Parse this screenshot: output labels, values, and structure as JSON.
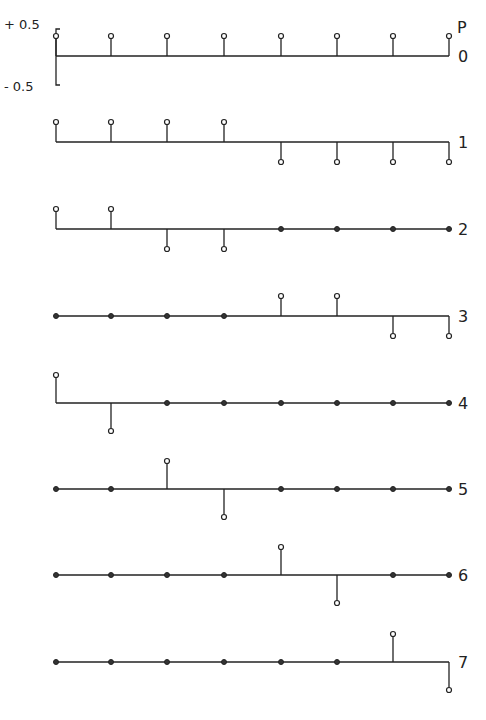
{
  "chart_data": {
    "type": "stem",
    "title": "",
    "y_axis": {
      "top_label": "+ 0.5",
      "bottom_label": "- 0.5",
      "ylim": [
        -0.5,
        0.5
      ]
    },
    "row_axis_label": "p",
    "samples_per_row": 8,
    "rows": [
      {
        "p": "0",
        "values": [
          0.5,
          0.5,
          0.5,
          0.5,
          0.5,
          0.5,
          0.5,
          0.5
        ]
      },
      {
        "p": "1",
        "values": [
          0.5,
          0.5,
          0.5,
          0.5,
          -0.5,
          -0.5,
          -0.5,
          -0.5
        ]
      },
      {
        "p": "2",
        "values": [
          0.5,
          0.5,
          -0.5,
          -0.5,
          0,
          0,
          0,
          0
        ]
      },
      {
        "p": "3",
        "values": [
          0,
          0,
          0,
          0,
          0.5,
          0.5,
          -0.5,
          -0.5
        ]
      },
      {
        "p": "4",
        "values": [
          0.7,
          -0.7,
          0,
          0,
          0,
          0,
          0,
          0
        ]
      },
      {
        "p": "5",
        "values": [
          0,
          0,
          0.7,
          -0.7,
          0,
          0,
          0,
          0
        ]
      },
      {
        "p": "6",
        "values": [
          0,
          0,
          0,
          0,
          0.7,
          -0.7,
          0,
          0
        ]
      },
      {
        "p": "7",
        "values": [
          0,
          0,
          0,
          0,
          0,
          0,
          0.7,
          -0.7
        ]
      }
    ]
  },
  "labels": {
    "plus": "+ 0.5",
    "minus": "- 0.5",
    "p": "P"
  },
  "colors": {
    "ink": "#222222",
    "background": "#ffffff"
  }
}
